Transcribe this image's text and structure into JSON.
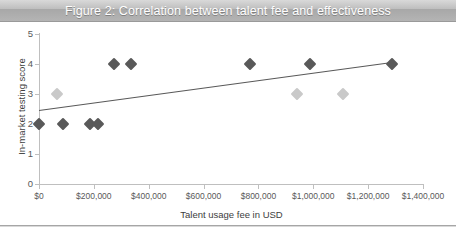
{
  "figure": {
    "title": "Figure 2: Correlation between talent fee and effectiveness",
    "title_bar_color": "#b3b3b3",
    "background": "#ffffff"
  },
  "chart_data": {
    "type": "scatter",
    "title": "Figure 2: Correlation between talent fee and effectiveness",
    "xlabel": "Talent usage fee in USD",
    "ylabel": "In-market testing score",
    "xlim": [
      0,
      1400000
    ],
    "ylim": [
      0,
      5
    ],
    "xticks": [
      0,
      200000,
      400000,
      600000,
      800000,
      1000000,
      1200000,
      1400000
    ],
    "xticklabels": [
      "$0",
      "$200,000",
      "$400,000",
      "$600,000",
      "$800,000",
      "$1,000,000",
      "$1,200,000",
      "$1,400,000"
    ],
    "yticks": [
      0,
      1,
      2,
      3,
      4,
      5
    ],
    "yticklabels": [
      "0",
      "1",
      "2",
      "3",
      "4",
      "5"
    ],
    "grid": false,
    "legend": null,
    "series": [
      {
        "name": "dark-markers",
        "color": "#595959",
        "marker": "diamond",
        "points": [
          {
            "x": 0,
            "y": 2
          },
          {
            "x": 87000,
            "y": 2
          },
          {
            "x": 186000,
            "y": 2
          },
          {
            "x": 215000,
            "y": 2
          },
          {
            "x": 273000,
            "y": 4
          },
          {
            "x": 335000,
            "y": 4
          },
          {
            "x": 769000,
            "y": 4
          },
          {
            "x": 988000,
            "y": 4
          },
          {
            "x": 1287000,
            "y": 4
          }
        ]
      },
      {
        "name": "light-markers",
        "color": "#c9c9c9",
        "marker": "diamond",
        "points": [
          {
            "x": 66000,
            "y": 3
          },
          {
            "x": 940000,
            "y": 3
          },
          {
            "x": 1108000,
            "y": 3
          }
        ]
      }
    ],
    "trendline": {
      "name": "linear-trend",
      "color": "#595959",
      "x_start": 0,
      "y_start": 2.45,
      "x_end": 1287000,
      "y_end": 4.05
    }
  }
}
